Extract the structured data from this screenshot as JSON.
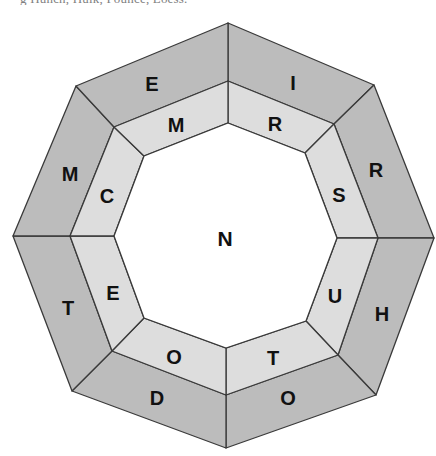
{
  "caption_fragment": "g        Hunch, Hulk, Pounce, Loess.",
  "puzzle": {
    "center_letter": "N",
    "outer_ring": [
      "I",
      "R",
      "H",
      "O",
      "D",
      "T",
      "M",
      "E"
    ],
    "middle_ring": [
      "R",
      "S",
      "U",
      "T",
      "O",
      "E",
      "C",
      "M"
    ]
  },
  "colors": {
    "outer_ring_fill": "#bcbcbc",
    "middle_ring_fill": "#dddddd",
    "center_fill": "#ffffff",
    "outline": "#3a3a3a",
    "letter": "#111111"
  }
}
